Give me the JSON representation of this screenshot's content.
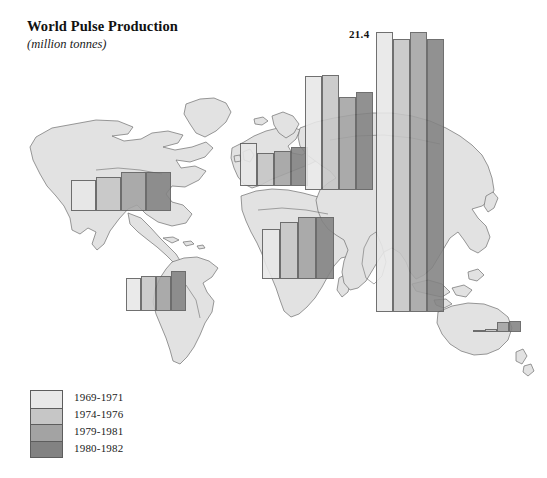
{
  "header": {
    "title": "World Pulse Production",
    "subtitle": "(million tonnes)"
  },
  "legend": {
    "title": "",
    "items": [
      {
        "label": "1969-1971",
        "color": "#e8e8e8"
      },
      {
        "label": "1974-1976",
        "color": "#c6c6c6"
      },
      {
        "label": "1979-1981",
        "color": "#a3a3a3"
      },
      {
        "label": "1980-1982",
        "color": "#828282"
      }
    ]
  },
  "annotations": {
    "peak_value": "21.4"
  },
  "chart_data": {
    "type": "bar",
    "title": "World Pulse Production",
    "subtitle": "(million tonnes)",
    "xlabel": "",
    "ylabel": "million tonnes",
    "grid": false,
    "legend_position": "bottom-left",
    "map_overlay": true,
    "series": [
      {
        "name": "1969-1971",
        "color": "#e8e8e8"
      },
      {
        "name": "1974-1976",
        "color": "#c6c6c6"
      },
      {
        "name": "1979-1981",
        "color": "#a3a3a3"
      },
      {
        "name": "1980-1982",
        "color": "#828282"
      }
    ],
    "categories": [
      "North America",
      "South America",
      "Europe",
      "Africa",
      "USSR / Eastern Europe",
      "Asia",
      "Oceania"
    ],
    "values": {
      "North America": [
        2.0,
        2.2,
        2.5,
        2.5
      ],
      "South America": [
        2.2,
        2.3,
        2.3,
        2.6
      ],
      "Europe": [
        2.8,
        2.2,
        2.3,
        2.6
      ],
      "Africa": [
        3.3,
        3.7,
        4.0,
        4.0
      ],
      "USSR / Eastern Europe": [
        9.6,
        9.7,
        6.9,
        7.4
      ],
      "Asia": [
        21.4,
        20.9,
        21.4,
        20.9
      ],
      "Oceania": [
        0.1,
        0.2,
        0.6,
        0.7
      ]
    },
    "annotated_points": [
      {
        "category": "Asia",
        "series": "1969-1971",
        "label": "21.4"
      }
    ]
  },
  "bar_groups": [
    {
      "name": "north-america",
      "x": 71,
      "baseline": 211,
      "bar_width": 25,
      "bars": [
        {
          "series": 0,
          "top": 180,
          "color": "#e8e8e8"
        },
        {
          "series": 1,
          "top": 177,
          "color": "#c6c6c6"
        },
        {
          "series": 2,
          "top": 172,
          "color": "#a3a3a3"
        },
        {
          "series": 3,
          "top": 172,
          "color": "#828282"
        }
      ]
    },
    {
      "name": "south-america",
      "x": 126,
      "baseline": 311,
      "bar_width": 15,
      "bars": [
        {
          "series": 0,
          "top": 278,
          "color": "#e8e8e8"
        },
        {
          "series": 1,
          "top": 276,
          "color": "#c6c6c6"
        },
        {
          "series": 2,
          "top": 276,
          "color": "#a3a3a3"
        },
        {
          "series": 3,
          "top": 271,
          "color": "#828282"
        }
      ]
    },
    {
      "name": "europe",
      "x": 240,
      "baseline": 186,
      "bar_width": 17,
      "bars": [
        {
          "series": 0,
          "top": 143,
          "color": "#e8e8e8"
        },
        {
          "series": 1,
          "top": 153,
          "color": "#c6c6c6"
        },
        {
          "series": 2,
          "top": 151,
          "color": "#a3a3a3"
        },
        {
          "series": 3,
          "top": 147,
          "color": "#828282"
        }
      ]
    },
    {
      "name": "africa",
      "x": 262,
      "baseline": 279,
      "bar_width": 18,
      "bars": [
        {
          "series": 0,
          "top": 229,
          "color": "#e8e8e8"
        },
        {
          "series": 1,
          "top": 222,
          "color": "#c6c6c6"
        },
        {
          "series": 2,
          "top": 217,
          "color": "#a3a3a3"
        },
        {
          "series": 3,
          "top": 217,
          "color": "#828282"
        }
      ]
    },
    {
      "name": "ussr-eastern-europe",
      "x": 305,
      "baseline": 190,
      "bar_width": 17,
      "bars": [
        {
          "series": 0,
          "top": 76,
          "color": "#e8e8e8"
        },
        {
          "series": 1,
          "top": 75,
          "color": "#c6c6c6"
        },
        {
          "series": 2,
          "top": 97,
          "color": "#a3a3a3"
        },
        {
          "series": 3,
          "top": 92,
          "color": "#828282"
        }
      ]
    },
    {
      "name": "asia",
      "x": 376,
      "baseline": 312,
      "bar_width": 17,
      "bars": [
        {
          "series": 0,
          "top": 32,
          "color": "#e8e8e8"
        },
        {
          "series": 1,
          "top": 39,
          "color": "#c6c6c6"
        },
        {
          "series": 2,
          "top": 32,
          "color": "#a3a3a3"
        },
        {
          "series": 3,
          "top": 39,
          "color": "#828282"
        }
      ]
    },
    {
      "name": "oceania",
      "x": 473,
      "baseline": 332,
      "bar_width": 12,
      "bars": [
        {
          "series": 0,
          "top": 330,
          "color": "#e8e8e8"
        },
        {
          "series": 1,
          "top": 329,
          "color": "#c6c6c6"
        },
        {
          "series": 2,
          "top": 322,
          "color": "#a3a3a3"
        },
        {
          "series": 3,
          "top": 321,
          "color": "#828282"
        }
      ]
    }
  ]
}
